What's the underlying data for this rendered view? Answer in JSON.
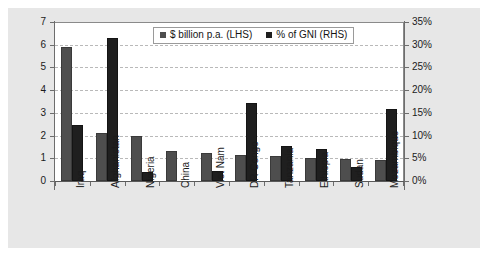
{
  "chart_data": {
    "type": "bar",
    "title": "",
    "subtitle": "",
    "xlabel": "",
    "ylabel": "",
    "grid": true,
    "legend_position": "top-center-inside",
    "categories": [
      "Iraq",
      "Afghanistan",
      "Nigeria",
      "China",
      "Viet Nam",
      "DR Congo",
      "Tanzania",
      "Ethiopia",
      "Sudan",
      "Mozambique"
    ],
    "axes": {
      "left": {
        "label": "$ billion p.a.",
        "min": 0,
        "max": 7,
        "step": 1,
        "ticks": [
          "0",
          "1",
          "2",
          "3",
          "4",
          "5",
          "6",
          "7"
        ]
      },
      "right": {
        "label": "% of GNI",
        "min": 0,
        "max": 35,
        "step": 5,
        "ticks": [
          "0%",
          "5%",
          "10%",
          "15%",
          "20%",
          "25%",
          "30%",
          "35%"
        ]
      }
    },
    "series": [
      {
        "name": "$ billion p.a. (LHS)",
        "axis": "left",
        "color": "#4e4e4e",
        "values": [
          5.9,
          2.1,
          2.0,
          1.3,
          1.23,
          1.15,
          1.08,
          1.0,
          0.95,
          0.92
        ]
      },
      {
        "name": "% of GNI (RHS)",
        "axis": "right",
        "color": "#1f1f1f",
        "values": [
          12.3,
          31.4,
          2.0,
          0,
          2.2,
          17.2,
          7.8,
          7.0,
          3.1,
          15.8
        ]
      }
    ]
  },
  "legend": {
    "entries": [
      {
        "label": "$ billion p.a. (LHS)",
        "swatch": "lhs"
      },
      {
        "label": "% of GNI (RHS)",
        "swatch": "rhs"
      }
    ]
  },
  "caption": {
    "remnant": "— —  — —  —   —  —   —"
  }
}
